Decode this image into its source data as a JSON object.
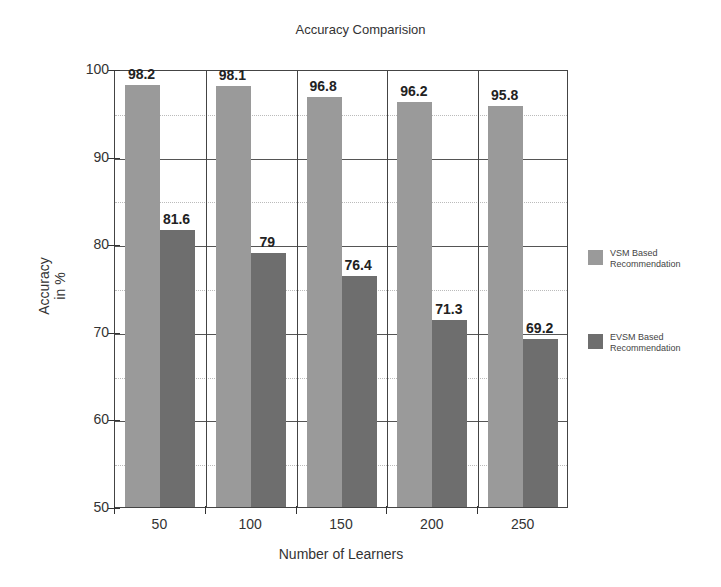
{
  "chart_data": {
    "type": "bar",
    "title": "Accuracy Comparision",
    "xlabel": "Number of Learners",
    "ylabel": "Accuracy in %",
    "ylabel_lines": [
      "Accuracy",
      "in %"
    ],
    "categories": [
      "50",
      "100",
      "150",
      "200",
      "250"
    ],
    "series": [
      {
        "name": "VSM Based Recommendation",
        "name_lines": [
          "VSM Based",
          "Recommendation"
        ],
        "color": "#9a9a9a",
        "values": [
          98.2,
          98.1,
          96.8,
          96.2,
          95.8
        ],
        "labels": [
          "98.2",
          "98.1",
          "96.8",
          "96.2",
          "95.8"
        ]
      },
      {
        "name": "EVSM Based Recommendation",
        "name_lines": [
          "EVSM Based",
          "Recommendation"
        ],
        "color": "#6e6e6e",
        "values": [
          81.6,
          79,
          76.4,
          71.3,
          69.2
        ],
        "labels": [
          "81.6",
          "79",
          "76.4",
          "71.3",
          "69.2"
        ]
      }
    ],
    "ylim": [
      50,
      100
    ],
    "yticks": [
      "50",
      "60",
      "70",
      "80",
      "90",
      "100"
    ],
    "grid": true,
    "legend_position": "right"
  }
}
